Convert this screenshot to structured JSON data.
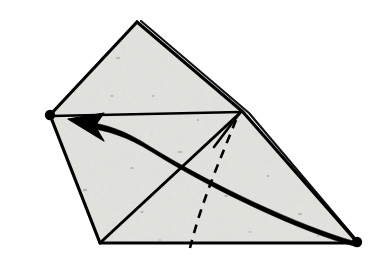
{
  "figure": {
    "kind": "origami-fold-diagram",
    "canvas": {
      "width": 377,
      "height": 266
    },
    "background_color": "#ffffff",
    "paper_fill_color": "#e9e9e6",
    "paper_texture": "speckled-recycled-paper",
    "ink_color": "#000000"
  },
  "geometry": {
    "paper_outline_points": "137,22 243,111 357,242 100,243 50,115",
    "vertices": [
      {
        "name": "top-apex",
        "x": 137,
        "y": 22
      },
      {
        "name": "right-junction",
        "x": 241,
        "y": 112
      },
      {
        "name": "bottom-right-corner",
        "x": 357,
        "y": 242
      },
      {
        "name": "bottom-left-corner",
        "x": 100,
        "y": 243
      },
      {
        "name": "left-corner",
        "x": 50,
        "y": 115
      }
    ],
    "edges": [
      {
        "name": "upper-left-edge",
        "from": "left-corner",
        "to": "top-apex",
        "path": "M 50 115 L 137 22",
        "style": "solid",
        "width": 3.2
      },
      {
        "name": "upper-right-edge",
        "from": "top-apex",
        "to": "bottom-right-corner",
        "path": "M 137 22 L 243 112 L 357 242",
        "style": "solid",
        "width": 3.2
      },
      {
        "name": "inner-layer-edge",
        "from": "top-apex",
        "to": "bottom-right-corner",
        "path": "M 141 21 L 249 113 L 359 243",
        "style": "solid",
        "width": 2.2
      },
      {
        "name": "bottom-edge",
        "from": "bottom-left-corner",
        "to": "bottom-right-corner",
        "path": "M 100 243 L 357 243",
        "style": "solid",
        "width": 3.0
      },
      {
        "name": "left-edge",
        "from": "left-corner",
        "to": "bottom-left-corner",
        "path": "M 50 115 L 100 243",
        "style": "solid",
        "width": 3.2
      }
    ],
    "crease_lines": [
      {
        "name": "horizontal-crease",
        "path": "M 51 116 L 241 112",
        "style": "solid",
        "width": 2.6
      },
      {
        "name": "diagonal-crease",
        "path": "M 101 242 L 240 113",
        "style": "solid",
        "width": 3.0
      },
      {
        "name": "short-crease-spur",
        "path": "M 239 114 L 214 147",
        "style": "solid",
        "width": 2.6
      },
      {
        "name": "hidden-fold-line",
        "path": "M 236 120 C 220 160 202 200 190 248",
        "style": "dashed",
        "width": 2.6,
        "dash_pattern": "9 7"
      }
    ],
    "markers": [
      {
        "name": "left-vertex-dot",
        "x": 50,
        "y": 115,
        "r": 5.2,
        "fill": "#000000"
      },
      {
        "name": "right-vertex-dot",
        "x": 357,
        "y": 242,
        "r": 5.2,
        "fill": "#000000"
      }
    ],
    "fold_arrow": {
      "name": "fold-direction-arrow",
      "description": "Thick curved arrow sweeping from the bottom-right dot up to the left dot, indicating the corner is folded across.",
      "shaft_path": "M 353 240 C 300 225 215 185 150 145 C 125 130 105 124 84 122",
      "shaft_width_start": 2.0,
      "shaft_width_end": 6.5,
      "head_points": "68,119 104,113 95,126 104,141",
      "color": "#000000"
    }
  }
}
